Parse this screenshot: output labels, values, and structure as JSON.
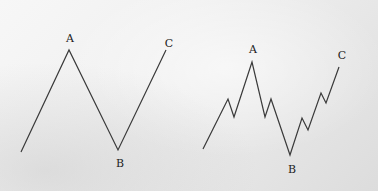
{
  "diagrams": [
    {
      "name": "simple-abc-wave",
      "labels": {
        "a": "A",
        "b": "B",
        "c": "C"
      },
      "points": [
        [
          21,
          152
        ],
        [
          69,
          50
        ],
        [
          118,
          150
        ],
        [
          166,
          50
        ]
      ]
    },
    {
      "name": "detailed-abc-wave",
      "labels": {
        "a": "A",
        "b": "B",
        "c": "C"
      },
      "points": [
        [
          203,
          149
        ],
        [
          228,
          99
        ],
        [
          234,
          117
        ],
        [
          252,
          62
        ],
        [
          265,
          117
        ],
        [
          271,
          99
        ],
        [
          290,
          155
        ],
        [
          302,
          118
        ],
        [
          308,
          130
        ],
        [
          321,
          93
        ],
        [
          326,
          103
        ],
        [
          339,
          67
        ]
      ]
    }
  ],
  "colors": {
    "line": "#3a3a3a",
    "label": "#222222"
  }
}
